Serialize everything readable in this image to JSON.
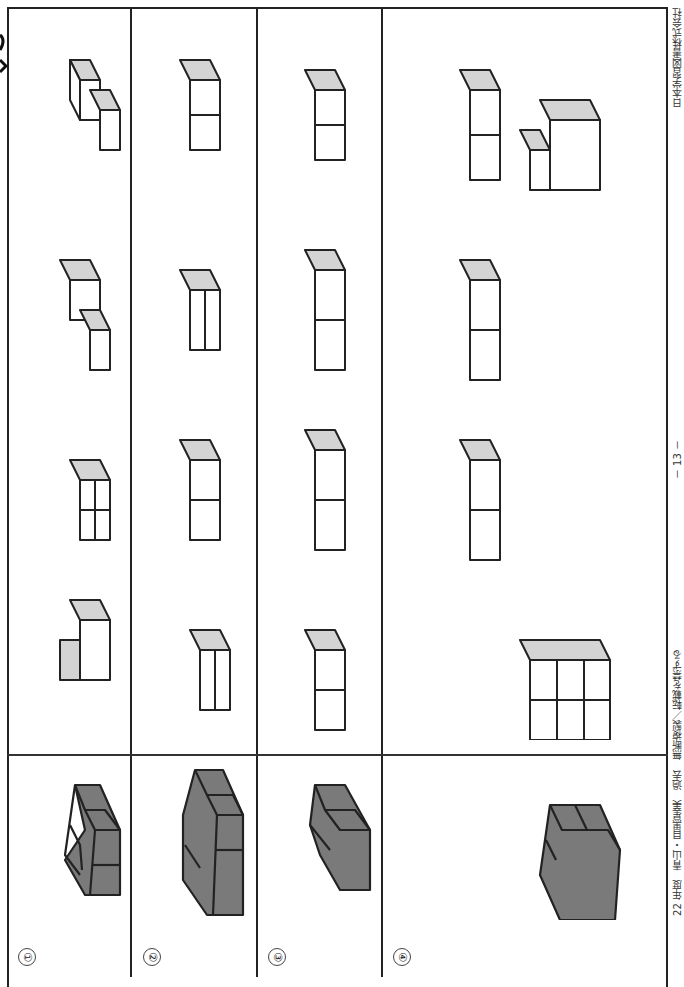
{
  "document": {
    "orientation": "rotated-90-clockwise",
    "rows": [
      {
        "label": "①",
        "given_shape": "dark-2x1x3-block",
        "options": 4
      },
      {
        "label": "②",
        "given_shape": "dark-long-block",
        "options": 4
      },
      {
        "label": "③",
        "given_shape": "dark-stepped-block",
        "options": 4
      },
      {
        "label": "④",
        "given_shape": "dark-2x2x2-cube",
        "options": 4
      }
    ],
    "footer": {
      "left_text": "22 年度　青山・目黒星美　過去　無断複製／転載を禁ずる",
      "page_number": "－ 13 －",
      "publisher": "日本学習図書株式会社"
    },
    "colors": {
      "line": "#222222",
      "dark_face": "#7a7a7a",
      "top_face": "#d4d4d4",
      "white_face": "#ffffff"
    }
  }
}
